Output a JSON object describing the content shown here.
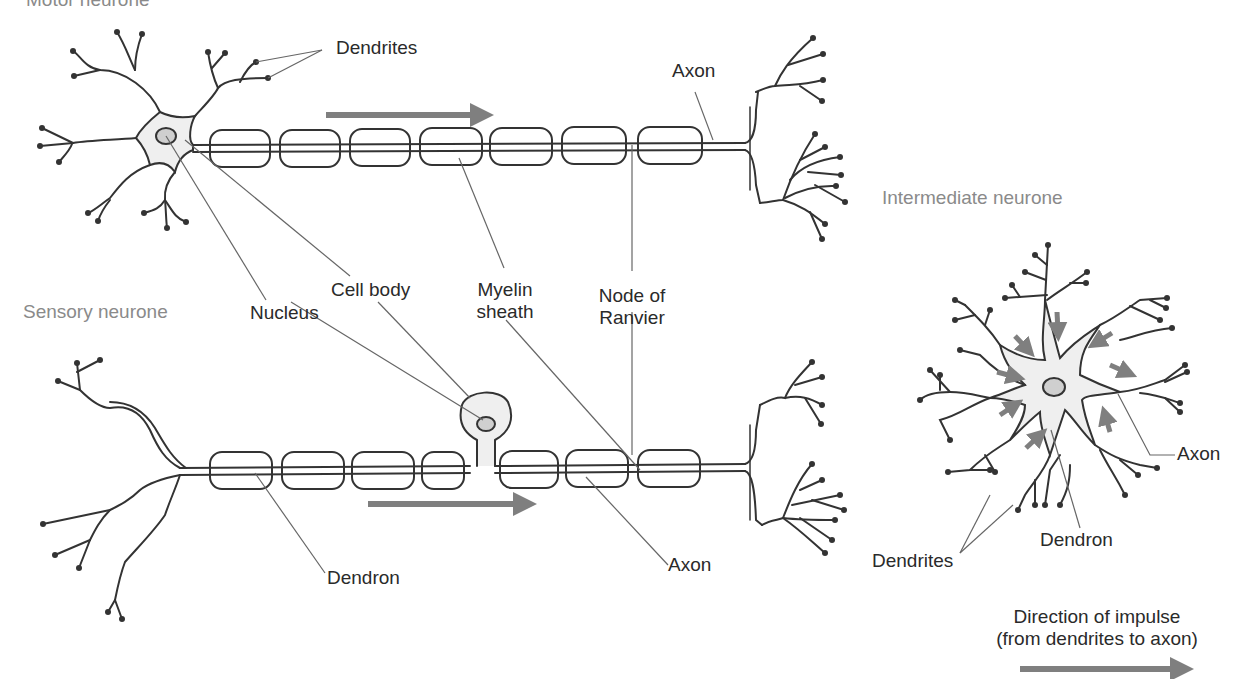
{
  "titles": {
    "motor": "Motor neurone",
    "sensory": "Sensory neurone",
    "intermediate": "Intermediate neurone"
  },
  "motor_labels": {
    "dendrites": "Dendrites",
    "axon": "Axon"
  },
  "shared_labels": {
    "nucleus": "Nucleus",
    "cell_body": "Cell body",
    "myelin_line1": "Myelin",
    "myelin_line2": "sheath",
    "node_line1": "Node of",
    "node_line2": "Ranvier"
  },
  "sensory_labels": {
    "dendron": "Dendron",
    "axon": "Axon"
  },
  "intermediate_labels": {
    "axon": "Axon",
    "dendron": "Dendron",
    "dendrites": "Dendrites"
  },
  "legend": {
    "line1": "Direction of impulse",
    "line2": "(from dendrites to axon)"
  },
  "colors": {
    "stroke": "#333333",
    "fill": "#efefef",
    "nucleus": "#cfcfcf",
    "arrow": "#7f7f7f",
    "leader": "#666666",
    "title": "#8a8a8a"
  }
}
